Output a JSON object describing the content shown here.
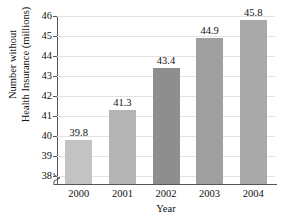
{
  "chart_data": {
    "type": "bar",
    "title": "Number of Americans without Health Insurance",
    "categories": [
      "2000",
      "2001",
      "2002",
      "2003",
      "2004"
    ],
    "values": [
      39.8,
      41.3,
      43.4,
      44.9,
      45.8
    ],
    "data_labels": [
      "39.8",
      "41.3",
      "43.4",
      "44.9",
      "45.8"
    ],
    "bar_colors": [
      "#c3c3c3",
      "#b4b4b4",
      "#8e8e8e",
      "#a0a0a0",
      "#a9a9a9"
    ],
    "xlabel": "Year",
    "ylabel_line1": "Number without",
    "ylabel_line2": "Health Insurance (millions)",
    "ylim": [
      37.6,
      46
    ],
    "ytick_labels": [
      "38",
      "39",
      "40",
      "41",
      "42",
      "43",
      "44",
      "45",
      "46"
    ],
    "ytick_values": [
      38,
      39,
      40,
      41,
      42,
      43,
      44,
      45,
      46
    ],
    "grid": true,
    "legend": "none",
    "axis_break": true
  }
}
